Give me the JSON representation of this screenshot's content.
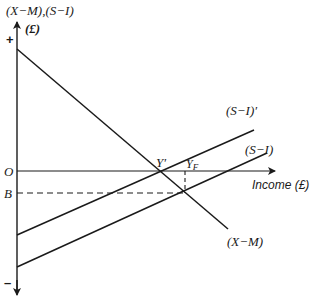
{
  "diagram": {
    "y_axis_label": "(X−M),(S−I)",
    "y_axis_unit": "(£)",
    "x_axis_label": "Income (£)",
    "plus_sign": "+",
    "minus_sign": "–",
    "origin_label": "O",
    "b_label": "B",
    "point_y_prime": "Y′",
    "point_yf_main": "Y",
    "point_yf_sub": "F",
    "line_labels": {
      "s_i_prime": "(S−I)′",
      "s_i": "(S−I)",
      "x_m": "(X−M)"
    },
    "colors": {
      "ink": "#1a1a1a",
      "background": "#ffffff"
    },
    "geometry": {
      "axis_x": 17,
      "origin_y": 171,
      "b_y": 193,
      "x_axis_end": 273,
      "x_m_line": [
        [
          17,
          49
        ],
        [
          228,
          229
        ]
      ],
      "s_i_prime_line": [
        [
          17,
          235
        ],
        [
          254,
          130
        ]
      ],
      "s_i_line": [
        [
          17,
          267
        ],
        [
          267,
          153
        ]
      ],
      "y_prime_point": [
        163,
        171
      ],
      "yf_point": [
        185,
        193
      ]
    }
  }
}
